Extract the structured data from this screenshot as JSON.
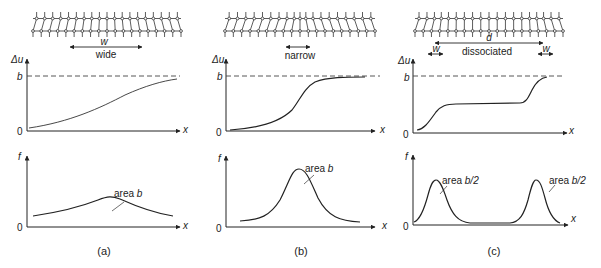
{
  "panels": [
    {
      "id": "a",
      "caption": "(a)",
      "width_symbol": "w",
      "width_label": "wide",
      "du_axis": {
        "ylabel": "Δu",
        "top_tick": "b",
        "origin": "0",
        "xlabel": "x"
      },
      "f_axis": {
        "ylabel": "f",
        "origin": "0",
        "xlabel": "x"
      },
      "f_annotation": {
        "prefix": "area ",
        "value": "b"
      }
    },
    {
      "id": "b",
      "caption": "(b)",
      "width_label": "narrow",
      "du_axis": {
        "ylabel": "Δu",
        "top_tick": "b",
        "origin": "0",
        "xlabel": "x"
      },
      "f_axis": {
        "ylabel": "f",
        "origin": "0",
        "xlabel": "x"
      },
      "f_annotation": {
        "prefix": "area ",
        "value": "b"
      }
    },
    {
      "id": "c",
      "caption": "(c)",
      "separation_symbol": "d",
      "width_label": "dissociated",
      "width_symbol_left": "w",
      "width_symbol_right": "w",
      "du_axis": {
        "ylabel": "Δu",
        "top_tick": "b",
        "origin": "0",
        "xlabel": "x"
      },
      "f_axis": {
        "ylabel": "f",
        "origin": "0",
        "xlabel": "x"
      },
      "f_annotation_left": {
        "prefix": "area ",
        "value": "b/2"
      },
      "f_annotation_right": {
        "prefix": "area ",
        "value": "b/2"
      }
    }
  ],
  "colors": {
    "ink": "#222222",
    "background": "#ffffff"
  }
}
